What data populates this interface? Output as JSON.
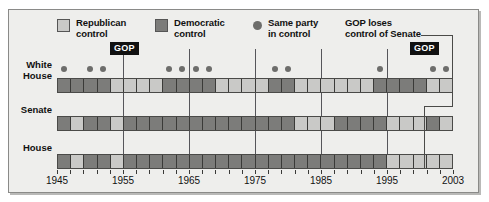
{
  "legend": {
    "items": [
      {
        "name": "republican-control",
        "label": "Republican\ncontrol",
        "marker": "square",
        "color": "#c9c9c7"
      },
      {
        "name": "democratic-control",
        "label": "Democratic\ncontrol",
        "marker": "square",
        "color": "#7c7c7a"
      },
      {
        "name": "same-party-in-control",
        "label": "Same party\nin control",
        "marker": "dot",
        "color": "#6d6d6b"
      },
      {
        "name": "gop-loses-senate",
        "label": "GOP loses\ncontrol of Senate",
        "marker": "none",
        "color": "#111111"
      }
    ]
  },
  "rows": {
    "white_house": "White\nHouse",
    "senate": "Senate",
    "house": "House"
  },
  "annotations": {
    "gop_label_left": "GOP",
    "gop_label_right": "GOP"
  },
  "axis": {
    "ticks": [
      1945,
      1955,
      1965,
      1975,
      1985,
      1995,
      2003
    ],
    "start_year": 1945,
    "end_year": 2003,
    "term_length_years": 2
  },
  "chart_data": {
    "type": "heatmap",
    "xlabel": "",
    "ylabel": "",
    "x": [
      1945,
      1947,
      1949,
      1951,
      1953,
      1955,
      1957,
      1959,
      1961,
      1963,
      1965,
      1967,
      1969,
      1971,
      1973,
      1975,
      1977,
      1979,
      1981,
      1983,
      1985,
      1987,
      1989,
      1991,
      1993,
      1995,
      1997,
      1999,
      2001,
      2003
    ],
    "xlim": [
      1945,
      2005
    ],
    "legend_position": "top",
    "grid": true,
    "value_map": {
      "R": "Republican control",
      "D": "Democratic control"
    },
    "series": [
      {
        "name": "White House",
        "values": [
          "D",
          "D",
          "D",
          "D",
          "R",
          "R",
          "R",
          "R",
          "D",
          "D",
          "D",
          "D",
          "R",
          "R",
          "R",
          "R",
          "D",
          "D",
          "R",
          "R",
          "R",
          "R",
          "R",
          "R",
          "D",
          "D",
          "D",
          "D",
          "R",
          "R"
        ]
      },
      {
        "name": "Senate",
        "values": [
          "D",
          "R",
          "D",
          "D",
          "R",
          "D",
          "D",
          "D",
          "D",
          "D",
          "D",
          "D",
          "D",
          "D",
          "D",
          "D",
          "D",
          "D",
          "R",
          "R",
          "R",
          "D",
          "D",
          "D",
          "D",
          "R",
          "R",
          "R",
          "D",
          "R"
        ]
      },
      {
        "name": "House",
        "values": [
          "D",
          "R",
          "D",
          "D",
          "R",
          "D",
          "D",
          "D",
          "D",
          "D",
          "D",
          "D",
          "D",
          "D",
          "D",
          "D",
          "D",
          "D",
          "D",
          "D",
          "D",
          "D",
          "D",
          "D",
          "D",
          "R",
          "R",
          "R",
          "R",
          "R"
        ]
      }
    ],
    "same_party_in_control_years": [
      1945,
      1949,
      1951,
      1961,
      1963,
      1965,
      1967,
      1977,
      1979,
      1993,
      2001,
      2003
    ],
    "annotations": [
      {
        "text": "GOP",
        "year": 1953,
        "note": "Republicans control White House, Senate and House"
      },
      {
        "text": "GOP",
        "year": 2001,
        "note": "Republicans control White House, Senate and House"
      },
      {
        "text": "GOP loses control of Senate",
        "year": 2001,
        "target_row": "Senate"
      }
    ]
  }
}
